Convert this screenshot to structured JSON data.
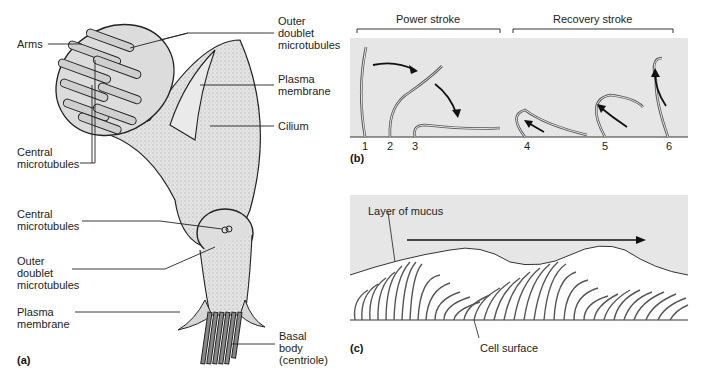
{
  "figure": {
    "panel_a": {
      "tag": "(a)",
      "labels": {
        "arms": "Arms",
        "outer_doublet_top": "Outer\ndoublet\nmicrotubules",
        "plasma_membrane_top": "Plasma\nmembrane",
        "cilium": "Cilium",
        "central_microtubules_top": "Central\nmicrotubules",
        "central_microtubules_mid": "Central\nmicrotubules",
        "outer_doublet_mid": "Outer\ndoublet\nmicrotubules",
        "plasma_membrane_bottom": "Plasma\nmembrane",
        "basal_body": "Basal\nbody\n(centriole)"
      }
    },
    "panel_b": {
      "tag": "(b)",
      "power_stroke": "Power stroke",
      "recovery_stroke": "Recovery stroke",
      "positions": [
        "1",
        "2",
        "3",
        "4",
        "5",
        "6"
      ]
    },
    "panel_c": {
      "tag": "(c)",
      "mucus_label": "Layer of mucus",
      "cell_surface_label": "Cell surface"
    },
    "colors": {
      "panel_gray": "#e6e6e6",
      "cilium_fill": "#d9d9d9",
      "ink": "#1a1a1a"
    }
  }
}
